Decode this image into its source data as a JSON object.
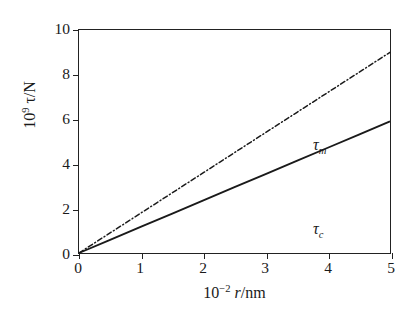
{
  "chart_data": {
    "type": "line",
    "title": "",
    "subtitle": "",
    "xlabel_plain": "10^-2 r/nm",
    "ylabel_plain": "10^9 tau/N",
    "xlim": [
      0,
      5
    ],
    "ylim": [
      0,
      10
    ],
    "xticks": [
      0,
      1,
      2,
      3,
      4,
      5
    ],
    "yticks": [
      0,
      2,
      4,
      6,
      8,
      10
    ],
    "xtick_labels": [
      "0",
      "1",
      "2",
      "3",
      "4",
      "5"
    ],
    "ytick_labels": [
      "0",
      "2",
      "4",
      "6",
      "8",
      "10"
    ],
    "grid": false,
    "legend_position": "inline-annotation",
    "series": [
      {
        "name": "tau_m",
        "label": "τ",
        "label_subscript": "m",
        "style": "dash-dot",
        "color": "#1a1a1a",
        "annotation_x": 3.05,
        "annotation_y": 6.55,
        "x": [
          0,
          0.5,
          1,
          1.5,
          2,
          2.5,
          3,
          3.5,
          4,
          4.5,
          5
        ],
        "values": [
          0,
          0.9,
          1.8,
          2.7,
          3.6,
          4.5,
          5.4,
          6.3,
          7.2,
          8.1,
          9.0
        ],
        "slope": 1.8
      },
      {
        "name": "tau_c",
        "label": "τ",
        "label_subscript": "c",
        "style": "solid",
        "color": "#1a1a1a",
        "annotation_x": 3.05,
        "annotation_y": 2.85,
        "x": [
          0,
          0.5,
          1,
          1.5,
          2,
          2.5,
          3,
          3.5,
          4,
          4.5,
          5
        ],
        "values": [
          0,
          0.59,
          1.18,
          1.77,
          2.36,
          2.95,
          3.54,
          4.13,
          4.72,
          5.31,
          5.9
        ],
        "slope": 1.18
      }
    ]
  },
  "axes": {
    "xlabel": {
      "mantissa": "10",
      "exponent": "−2",
      "variable": "r",
      "unit": "/nm"
    },
    "ylabel": {
      "mantissa": "10",
      "exponent": "9",
      "variable": "τ",
      "unit": "/N"
    }
  },
  "annotations": {
    "tau_m": {
      "symbol": "τ",
      "subscript": "m"
    },
    "tau_c": {
      "symbol": "τ",
      "subscript": "c"
    }
  },
  "style": {
    "axis_color": "#222222",
    "text_color": "#1a1a1a",
    "background": "#ffffff"
  }
}
